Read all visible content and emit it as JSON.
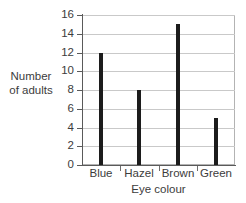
{
  "chart_data": {
    "type": "bar",
    "title": "",
    "subtitle": "",
    "categories": [
      "Blue",
      "Hazel",
      "Brown",
      "Green"
    ],
    "values": [
      12,
      8,
      15,
      5
    ],
    "xlabel": "Eye colour",
    "ylabel": "Number of adults",
    "ylabel_lines": [
      "Number",
      "of adults"
    ],
    "ylim": [
      0,
      16
    ],
    "ytick_step": 2,
    "yticks": [
      0,
      2,
      4,
      6,
      8,
      10,
      12,
      14,
      16
    ],
    "ytick_labels": [
      "0",
      "2",
      "4",
      "6",
      "8",
      "10",
      "12",
      "14",
      "16"
    ],
    "grid": "horizontal",
    "legend": "none",
    "annotations": [],
    "colors": {
      "bar": "#1c1c1c",
      "gridline": "#c9c9c9",
      "axis": "#5a5a5a",
      "frame": "#b3b3b3",
      "text": "#3c3c3c",
      "background": "#ffffff"
    }
  }
}
